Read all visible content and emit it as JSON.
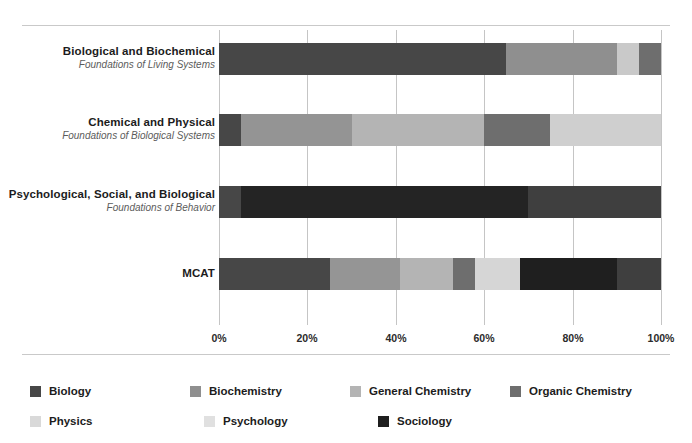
{
  "chart_data": {
    "type": "bar",
    "subtype": "100% stacked horizontal bar",
    "title": "",
    "xlabel": "",
    "ylabel": "",
    "xlim": [
      0,
      100
    ],
    "grid": true,
    "grid_values": [
      0,
      20,
      40,
      60,
      80,
      100
    ],
    "tick_labels": [
      "0%",
      "20%",
      "40%",
      "60%",
      "80%",
      "100%"
    ],
    "legend_position": "bottom-left",
    "categories": [
      {
        "main": "Biological and Biochemical",
        "sub": "Foundations of Living Systems"
      },
      {
        "main": "Chemical and Physical",
        "sub": "Foundations of Biological Systems"
      },
      {
        "main": "Psychological, Social, and Biological",
        "sub": "Foundations of Behavior"
      },
      {
        "main": "MCAT",
        "sub": ""
      }
    ],
    "series": [
      {
        "name": "Biology",
        "color": "#474747",
        "values": [
          65,
          5,
          5,
          25
        ]
      },
      {
        "name": "Biochemistry",
        "color": "#8f8f8f",
        "values": [
          25,
          25,
          0,
          16
        ]
      },
      {
        "name": "General Chemistry",
        "color": "#b0b0b0",
        "values": [
          0,
          30,
          0,
          12
        ]
      },
      {
        "name": "Organic Chemistry",
        "color": "#6e6e6e",
        "values": [
          0,
          15,
          0,
          5
        ]
      },
      {
        "name": "Physics",
        "color": "#d5d5d5",
        "values": [
          5,
          25,
          0,
          10
        ]
      },
      {
        "name": "Psychology",
        "color": "#dedede",
        "values": [
          0,
          0,
          0,
          0
        ]
      },
      {
        "name": "Sociology",
        "color": "#1f1f1f",
        "values": [
          0,
          0,
          65,
          22
        ]
      }
    ],
    "bars": [
      {
        "label": "Biological and Biochemical",
        "segments": [
          {
            "name": "Biology",
            "value": 65,
            "color": "#474747"
          },
          {
            "name": "Biochemistry",
            "value": 25,
            "color": "#8f8f8f"
          },
          {
            "name": "Physics",
            "value": 5,
            "color": "#c9c9c9"
          },
          {
            "name": "Organic Chemistry",
            "value": 5,
            "color": "#6e6e6e"
          }
        ]
      },
      {
        "label": "Chemical and Physical",
        "segments": [
          {
            "name": "Biology",
            "value": 5,
            "color": "#474747"
          },
          {
            "name": "Biochemistry",
            "value": 25,
            "color": "#949494"
          },
          {
            "name": "General Chemistry",
            "value": 30,
            "color": "#b4b4b4"
          },
          {
            "name": "Organic Chemistry",
            "value": 15,
            "color": "#6e6e6e"
          },
          {
            "name": "Physics",
            "value": 25,
            "color": "#cfcfcf"
          }
        ]
      },
      {
        "label": "Psychological, Social, and Biological",
        "segments": [
          {
            "name": "Biology",
            "value": 5,
            "color": "#474747"
          },
          {
            "name": "Psychology",
            "value": 65,
            "color": "#242424"
          },
          {
            "name": "Sociology",
            "value": 30,
            "color": "#3f3f3f"
          }
        ]
      },
      {
        "label": "MCAT",
        "segments": [
          {
            "name": "Biology",
            "value": 25,
            "color": "#474747"
          },
          {
            "name": "Biochemistry",
            "value": 16,
            "color": "#959595"
          },
          {
            "name": "General Chemistry",
            "value": 12,
            "color": "#b4b4b4"
          },
          {
            "name": "Organic Chemistry",
            "value": 5,
            "color": "#6e6e6e"
          },
          {
            "name": "Physics",
            "value": 10,
            "color": "#d6d6d6"
          },
          {
            "name": "Psychology",
            "value": 22,
            "color": "#1f1f1f"
          },
          {
            "name": "Sociology",
            "value": 10,
            "color": "#3f3f3f"
          }
        ]
      }
    ],
    "legend": [
      {
        "label": "Biology",
        "color": "#474747"
      },
      {
        "label": "Biochemistry",
        "color": "#8f8f8f"
      },
      {
        "label": "General Chemistry",
        "color": "#b4b4b4"
      },
      {
        "label": "Organic Chemistry",
        "color": "#6e6e6e"
      },
      {
        "label": "Physics",
        "color": "#d9d9d9"
      },
      {
        "label": "Psychology",
        "color": "#e0e0e0"
      },
      {
        "label": "Sociology",
        "color": "#1f1f1f"
      }
    ]
  },
  "colors": {
    "gridline": "#c5c5c5",
    "frame_rule": "#c9c9c9",
    "label_main": "#1c1c1c",
    "label_sub": "#5b5b5b",
    "background": "#ffffff"
  }
}
